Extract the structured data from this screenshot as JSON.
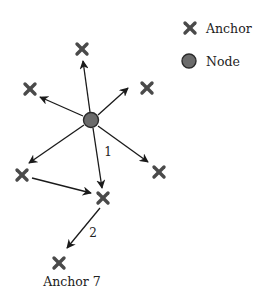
{
  "legend": {
    "items": [
      {
        "symbol": "x-mark",
        "label": "Anchor"
      },
      {
        "symbol": "circle",
        "label": "Node"
      }
    ]
  },
  "colors": {
    "anchor": "#4a4a4a",
    "node_fill": "#6b6b6b",
    "node_stroke": "#2a2a2a",
    "arrow": "#1a1a1a",
    "text": "#222222"
  },
  "diagram": {
    "node": {
      "x": 91,
      "y": 120,
      "r": 8
    },
    "anchors": [
      {
        "id": "a1",
        "x": 82,
        "y": 49
      },
      {
        "id": "a2",
        "x": 30,
        "y": 89
      },
      {
        "id": "a3",
        "x": 147,
        "y": 88
      },
      {
        "id": "a4",
        "x": 22,
        "y": 175
      },
      {
        "id": "a5",
        "x": 159,
        "y": 172
      },
      {
        "id": "a6",
        "x": 103,
        "y": 198
      },
      {
        "id": "a7",
        "x": 59,
        "y": 263,
        "label": "Anchor 7"
      }
    ],
    "edge_labels": [
      {
        "text": "1",
        "x": 108,
        "y": 156
      },
      {
        "text": "2",
        "x": 93,
        "y": 237
      }
    ],
    "anchor7_label": "Anchor 7"
  }
}
